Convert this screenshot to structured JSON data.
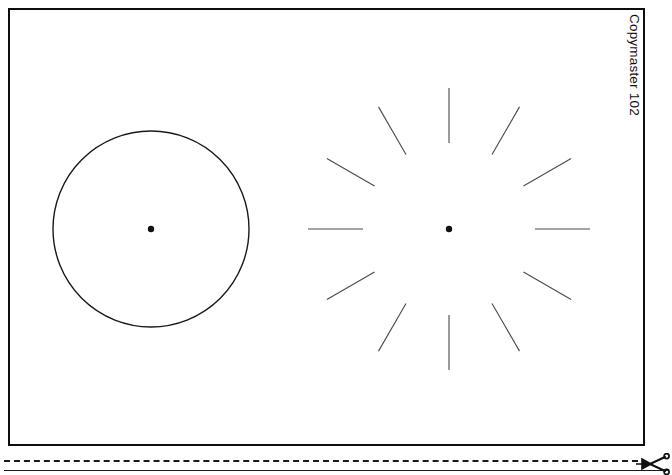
{
  "page": {
    "width": 672,
    "height": 475,
    "background_color": "#ffffff",
    "ink_color": "#111111"
  },
  "card": {
    "name": "test-pattern-card",
    "border_color": "#0d0d0d",
    "border_width_px": 2.5,
    "x": 8,
    "y": 8,
    "width": 637,
    "height": 438
  },
  "side_caption": {
    "text": "Copymaster 102",
    "rotation_deg": 90,
    "color": "#111111"
  },
  "figures": [
    {
      "name": "circle-test-figure",
      "type": "circle",
      "center_x": 151,
      "center_y": 229,
      "radius": 98,
      "stroke_color": "#1a1a1a",
      "stroke_width": 1.4,
      "fill": "none",
      "center_dot": true,
      "center_dot_radius": 3.2
    },
    {
      "name": "radial-tick-test-figure",
      "type": "radial-ticks",
      "center_x": 449,
      "center_y": 229,
      "tick_count": 12,
      "angle_step_deg": 30,
      "start_angle_deg": -90,
      "inner_radius": 86,
      "outer_radius": 141,
      "stroke_color": "#4a4a4a",
      "stroke_width": 1.1,
      "center_dot": true,
      "center_dot_radius": 3.2
    }
  ],
  "cut_line": {
    "name": "cut-here-line",
    "style": "dashed",
    "dash_color": "#1a1a1a",
    "baseline_color": "#1a1a1a",
    "icon": "scissors-icon"
  }
}
